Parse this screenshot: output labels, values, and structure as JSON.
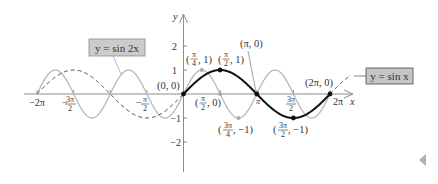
{
  "chart_data": {
    "type": "line",
    "title": "",
    "xlabel": "x",
    "ylabel": "y",
    "xlim": [
      -6.2832,
      7.0
    ],
    "ylim": [
      -3.2,
      3.3
    ],
    "grid": false,
    "x_ticks": [
      "-2π",
      "-3π/2",
      "-π/2",
      "π",
      "3π/2",
      "2π"
    ],
    "y_ticks": [
      "2",
      "1",
      "-1",
      "-2"
    ],
    "series": [
      {
        "name": "y = sin x",
        "style": "solid black on [0, 2π]; dashed outside",
        "color": "#111111",
        "points": [
          [
            0,
            0
          ],
          [
            1.5708,
            1
          ],
          [
            3.1416,
            0
          ],
          [
            4.7124,
            -1
          ],
          [
            6.2832,
            0
          ]
        ]
      },
      {
        "name": "y = sin 2x",
        "style": "solid light gray",
        "color": "#b5b5b5",
        "points": [
          [
            0,
            0
          ],
          [
            0.7854,
            1
          ],
          [
            1.5708,
            0
          ],
          [
            2.3562,
            -1
          ],
          [
            3.1416,
            0
          ]
        ]
      }
    ],
    "annotations": [
      {
        "text": "(0, 0)",
        "x": 0,
        "y": 0
      },
      {
        "text": "(π/4, 1)",
        "x": 0.7854,
        "y": 1
      },
      {
        "text": "(π/2, 1)",
        "x": 1.5708,
        "y": 1
      },
      {
        "text": "(π/2, 0)",
        "x": 1.5708,
        "y": 0
      },
      {
        "text": "(π, 0)",
        "x": 3.1416,
        "y": 0
      },
      {
        "text": "(3π/4, −1)",
        "x": 2.3562,
        "y": -1
      },
      {
        "text": "(3π/2, −1)",
        "x": 4.7124,
        "y": -1
      },
      {
        "text": "(2π, 0)",
        "x": 6.2832,
        "y": 0
      }
    ],
    "legend": [
      {
        "label": "y = sin 2x",
        "position": "upper-left callout"
      },
      {
        "label": "y = sin x",
        "position": "right callout"
      }
    ]
  },
  "labels": {
    "axis_x": "x",
    "axis_y": "y",
    "sin2x_box": "y = sin 2x",
    "sinx_box": "y = sin x",
    "yt_2": "2",
    "yt_1": "1",
    "yt_m1": "−1",
    "yt_m2": "−2",
    "xt_m2pi": "−2π",
    "xt_m3pi2_minus": "−",
    "xt_m3pi2_num": "3π",
    "xt_m3pi2_den": "2",
    "xt_mpi2_minus": "−",
    "xt_mpi2_num": "π",
    "xt_mpi2_den": "2",
    "xt_pi": "π",
    "xt_3pi2_num": "3π",
    "xt_3pi2_den": "2",
    "xt_2pi": "2π",
    "pt_origin": "(0, 0)",
    "pt_pi4_1_open": "(",
    "pt_pi4_1_num": "π",
    "pt_pi4_1_den": "4",
    "pt_pi4_1_close": ", 1)",
    "pt_pi2_1_open": "(",
    "pt_pi2_1_num": "π",
    "pt_pi2_1_den": "2",
    "pt_pi2_1_close": ", 1)",
    "pt_pi2_0_open": "(",
    "pt_pi2_0_num": "π",
    "pt_pi2_0_den": "2",
    "pt_pi2_0_close": ", 0)",
    "pt_pi_0": "(π, 0)",
    "pt_3pi4_open": "(",
    "pt_3pi4_num": "3π",
    "pt_3pi4_den": "4",
    "pt_3pi4_close": ", −1)",
    "pt_3pi2_open": "(",
    "pt_3pi2_num": "3π",
    "pt_3pi2_den": "2",
    "pt_3pi2_close": ", −1)",
    "pt_2pi_0": "(2π, 0)"
  },
  "nav": {
    "prev_icon": "triangle-left-icon"
  },
  "colors": {
    "axis": "#8c8c8c",
    "sinx": "#111111",
    "sin2x": "#b8b8b8",
    "box_fill": "#c9c9c9",
    "box_stroke": "#6a6a6a",
    "nav_arrow": "#b0b0b0"
  }
}
